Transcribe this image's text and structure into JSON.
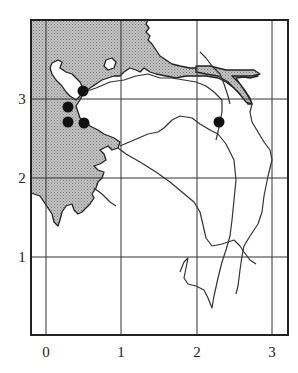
{
  "map": {
    "type": "coordinate-grid-map",
    "x_axis": {
      "ticks": [
        "0",
        "1",
        "2",
        "3"
      ]
    },
    "y_axis": {
      "ticks": [
        "1",
        "2",
        "3"
      ]
    },
    "colors": {
      "sea_fill": "#b8b8b8",
      "land_fill": "#ffffff",
      "line": "#333333",
      "marker": "#111111"
    },
    "markers": [
      {
        "id": "site-1",
        "x": 0.5,
        "y": 3.1
      },
      {
        "id": "site-2",
        "x": 0.3,
        "y": 2.9
      },
      {
        "id": "site-3",
        "x": 0.3,
        "y": 2.7
      },
      {
        "id": "site-4",
        "x": 0.5,
        "y": 2.7
      },
      {
        "id": "site-5",
        "x": 2.3,
        "y": 2.7
      }
    ]
  }
}
